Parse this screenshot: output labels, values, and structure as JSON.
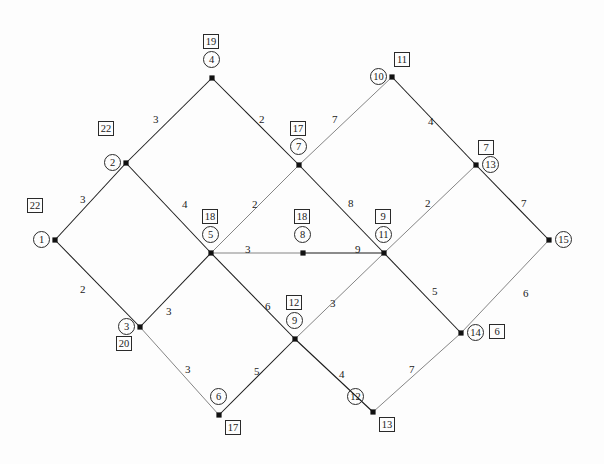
{
  "figure": {
    "name": "weighted-graph-shortest-path-diagram",
    "width": 604,
    "height": 464,
    "background_color": "#fdfdfd",
    "line_color": "#1b1b1b"
  },
  "chart_data": {
    "type": "diagram",
    "subtype": "node-link weighted graph",
    "title": "",
    "xlabel": "",
    "ylabel": "",
    "grid": false,
    "legend": "none",
    "node_id_shape": "circle",
    "node_label_shape": "square",
    "nodes": [
      {
        "id": "1",
        "label": "22",
        "x": 55,
        "y": 240,
        "id_pos": "left",
        "label_pos": "above-left"
      },
      {
        "id": "2",
        "label": "22",
        "x": 126,
        "y": 163,
        "id_pos": "left",
        "label_pos": "above-left"
      },
      {
        "id": "3",
        "label": "20",
        "x": 140,
        "y": 327,
        "id_pos": "left",
        "label_pos": "below-left"
      },
      {
        "id": "4",
        "label": "19",
        "x": 212,
        "y": 78,
        "id_pos": "above",
        "label_pos": "above-top"
      },
      {
        "id": "5",
        "label": "18",
        "x": 211,
        "y": 253,
        "id_pos": "above",
        "label_pos": "above-top"
      },
      {
        "id": "6",
        "label": "17",
        "x": 219,
        "y": 415,
        "id_pos": "above",
        "label_pos": "below-right"
      },
      {
        "id": "7",
        "label": "17",
        "x": 299,
        "y": 165,
        "id_pos": "above",
        "label_pos": "above-top"
      },
      {
        "id": "8",
        "label": "18",
        "x": 303,
        "y": 253,
        "id_pos": "above",
        "label_pos": "above-top"
      },
      {
        "id": "9",
        "label": "12",
        "x": 295,
        "y": 339,
        "id_pos": "above",
        "label_pos": "above-top"
      },
      {
        "id": "10",
        "label": "11",
        "x": 392,
        "y": 77,
        "id_pos": "left",
        "label_pos": "above-right"
      },
      {
        "id": "11",
        "label": "9",
        "x": 384,
        "y": 253,
        "id_pos": "above",
        "label_pos": "above-top"
      },
      {
        "id": "12",
        "label": "13",
        "x": 373,
        "y": 412,
        "id_pos": "above-left",
        "label_pos": "below-right"
      },
      {
        "id": "13",
        "label": "7",
        "x": 476,
        "y": 165,
        "id_pos": "right",
        "label_pos": "above-right"
      },
      {
        "id": "14",
        "label": "6",
        "x": 461,
        "y": 333,
        "id_pos": "right",
        "label_pos": "far-right"
      },
      {
        "id": "15",
        "label": "",
        "x": 549,
        "y": 240,
        "id_pos": "right",
        "label_pos": "none"
      }
    ],
    "edges": [
      {
        "from": "1",
        "to": "2",
        "weight": 3,
        "style": "solid",
        "label_x": 80,
        "label_y": 193
      },
      {
        "from": "1",
        "to": "3",
        "weight": 2,
        "style": "solid",
        "label_x": 80,
        "label_y": 283
      },
      {
        "from": "2",
        "to": "4",
        "weight": 3,
        "style": "solid",
        "label_x": 153,
        "label_y": 113
      },
      {
        "from": "2",
        "to": "5",
        "weight": 4,
        "style": "solid",
        "label_x": 182,
        "label_y": 198
      },
      {
        "from": "3",
        "to": "5",
        "weight": 3,
        "style": "solid",
        "label_x": 166,
        "label_y": 305
      },
      {
        "from": "3",
        "to": "6",
        "weight": 3,
        "style": "light",
        "label_x": 185,
        "label_y": 363
      },
      {
        "from": "4",
        "to": "7",
        "weight": 2,
        "style": "solid",
        "label_x": 259,
        "label_y": 113
      },
      {
        "from": "5",
        "to": "7",
        "weight": 2,
        "style": "light",
        "label_x": 252,
        "label_y": 198
      },
      {
        "from": "5",
        "to": "8",
        "weight": 3,
        "style": "light",
        "label_x": 245,
        "label_y": 243
      },
      {
        "from": "5",
        "to": "9",
        "weight": 6,
        "style": "solid",
        "label_x": 265,
        "label_y": 300
      },
      {
        "from": "6",
        "to": "9",
        "weight": 5,
        "style": "solid",
        "label_x": 254,
        "label_y": 365
      },
      {
        "from": "7",
        "to": "10",
        "weight": 7,
        "style": "light",
        "label_x": 332,
        "label_y": 113
      },
      {
        "from": "7",
        "to": "11",
        "weight": 8,
        "style": "solid",
        "label_x": 348,
        "label_y": 197
      },
      {
        "from": "8",
        "to": "11",
        "weight": 9,
        "style": "solid",
        "label_x": 355,
        "label_y": 243
      },
      {
        "from": "9",
        "to": "11",
        "weight": 3,
        "style": "light",
        "label_x": 330,
        "label_y": 297
      },
      {
        "from": "9",
        "to": "12",
        "weight": 4,
        "style": "solid",
        "label_x": 339,
        "label_y": 368
      },
      {
        "from": "10",
        "to": "13",
        "weight": 4,
        "style": "solid",
        "label_x": 428,
        "label_y": 115
      },
      {
        "from": "11",
        "to": "13",
        "weight": 2,
        "style": "light",
        "label_x": 425,
        "label_y": 197
      },
      {
        "from": "11",
        "to": "14",
        "weight": 5,
        "style": "solid",
        "label_x": 432,
        "label_y": 285
      },
      {
        "from": "12",
        "to": "14",
        "weight": 7,
        "style": "light",
        "label_x": 409,
        "label_y": 363
      },
      {
        "from": "13",
        "to": "15",
        "weight": 7,
        "style": "solid",
        "label_x": 521,
        "label_y": 197
      },
      {
        "from": "14",
        "to": "15",
        "weight": 6,
        "style": "light",
        "label_x": 523,
        "label_y": 287
      }
    ]
  }
}
